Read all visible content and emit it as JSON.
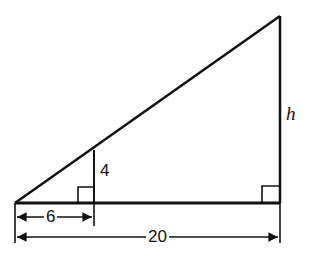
{
  "diagram": {
    "type": "similar-right-triangles",
    "labels": {
      "inner_height": "4",
      "outer_height": "h",
      "inner_base": "6",
      "outer_base": "20"
    },
    "colors": {
      "stroke": "#111111",
      "background": "#ffffff"
    }
  }
}
